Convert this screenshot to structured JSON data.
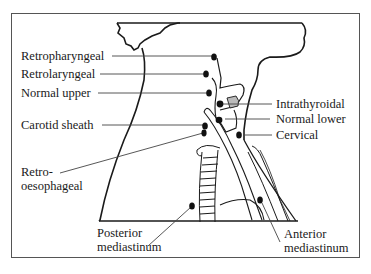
{
  "diagram": {
    "labels": {
      "retropharyngeal": "Retropharyngeal",
      "retrolaryngeal": "Retrolaryngeal",
      "normal_upper": "Normal upper",
      "carotid_sheath": "Carotid sheath",
      "retro_oesophageal_line1": "Retro-",
      "retro_oesophageal_line2": "oesophageal",
      "intrathyroidal": "Intrathyroidal",
      "normal_lower": "Normal lower",
      "cervical": "Cervical",
      "posterior_mediastinum_line1": "Posterior",
      "posterior_mediastinum_line2": "mediastinum",
      "anterior_mediastinum_line1": "Anterior",
      "anterior_mediastinum_line2": "mediastinum"
    },
    "colors": {
      "ink": "#1a1a1a",
      "leader": "#444444",
      "frame": "#555555",
      "background": "#ffffff"
    }
  }
}
